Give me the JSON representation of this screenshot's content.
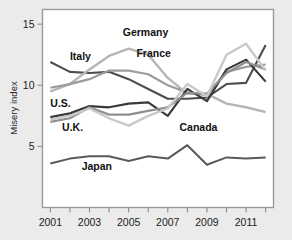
{
  "chart_data": {
    "type": "line",
    "title": "",
    "subtitle": "",
    "xlabel": "",
    "ylabel": "Misery index",
    "xlim": [
      2000.6,
      2012.4
    ],
    "ylim": [
      0,
      16.2
    ],
    "grid": false,
    "legend_position": "inline-labels",
    "x_tick_labels": [
      "2001",
      "2003",
      "2005",
      "2007",
      "2009",
      "2011"
    ],
    "x_tick_values": [
      2001,
      2003,
      2005,
      2007,
      2009,
      2011
    ],
    "x_minor_tick_values": [
      2001,
      2002,
      2003,
      2004,
      2005,
      2006,
      2007,
      2008,
      2009,
      2010,
      2011,
      2012
    ],
    "y_tick_labels": [
      "5",
      "10",
      "15"
    ],
    "y_tick_values": [
      5,
      10,
      15
    ],
    "x": [
      2001,
      2002,
      2003,
      2004,
      2005,
      2006,
      2007,
      2008,
      2009,
      2010,
      2011,
      2012
    ],
    "series": [
      {
        "name": "Italy",
        "color": "#4d4d4d",
        "width": 2.1,
        "values": [
          11.9,
          11.1,
          11.0,
          11.1,
          10.5,
          9.7,
          8.9,
          8.9,
          9.0,
          10.1,
          10.2,
          13.3
        ]
      },
      {
        "name": "Germany",
        "color": "#b5b5b5",
        "width": 2.4,
        "values": [
          9.5,
          10.1,
          11.3,
          12.4,
          13.0,
          12.5,
          10.6,
          9.3,
          9.3,
          8.5,
          8.2,
          7.8
        ]
      },
      {
        "name": "France",
        "color": "#9c9c9c",
        "width": 2.2,
        "values": [
          9.8,
          10.1,
          10.5,
          11.2,
          11.2,
          10.9,
          10.0,
          9.4,
          9.2,
          11.1,
          11.5,
          11.7
        ]
      },
      {
        "name": "U.S.",
        "color": "#3a3a3a",
        "width": 2.2,
        "values": [
          7.4,
          7.7,
          8.3,
          8.2,
          8.5,
          8.6,
          7.5,
          9.7,
          8.7,
          11.3,
          12.1,
          10.3
        ]
      },
      {
        "name": "U.K.",
        "color": "#8f8f8f",
        "width": 2.2,
        "values": [
          7.0,
          7.3,
          8.2,
          7.6,
          7.6,
          7.9,
          8.2,
          9.4,
          9.3,
          11.0,
          11.9,
          11.3
        ]
      },
      {
        "name": "Canada",
        "color": "#c9c9c9",
        "width": 2.4,
        "values": [
          7.2,
          7.5,
          8.1,
          7.3,
          6.7,
          7.5,
          8.1,
          10.1,
          9.1,
          12.5,
          13.4,
          11.2
        ]
      },
      {
        "name": "Japan",
        "color": "#5a5a5a",
        "width": 2.0,
        "values": [
          3.6,
          4.0,
          4.2,
          4.2,
          3.8,
          4.2,
          4.0,
          5.1,
          3.5,
          4.1,
          4.0,
          4.1
        ]
      }
    ],
    "annotations": [
      {
        "text": "Italy",
        "x": 2002.0,
        "y": 12.1
      },
      {
        "text": "Germany",
        "x": 2004.7,
        "y": 14.0
      },
      {
        "text": "France",
        "x": 2005.4,
        "y": 12.3
      },
      {
        "text": "U.S.",
        "x": 2001.0,
        "y": 8.2
      },
      {
        "text": "U.K.",
        "x": 2001.6,
        "y": 6.3
      },
      {
        "text": "Canada",
        "x": 2007.6,
        "y": 6.3
      },
      {
        "text": "Japan",
        "x": 2002.6,
        "y": 3.1
      }
    ]
  },
  "axes": {
    "y_axis_title": "Misery index"
  }
}
